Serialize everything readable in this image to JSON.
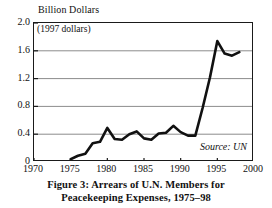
{
  "figure": {
    "y_axis_title": "Billion Dollars",
    "deflator_note": "(1997 dollars)",
    "source_note": "Source: UN",
    "caption_line1": "Figure 3: Arrears of U.N. Members for",
    "caption_line2": "Peacekeeping Expenses, 1975–98"
  },
  "chart_data": {
    "type": "line",
    "title": "Figure 3: Arrears of U.N. Members for Peacekeeping Expenses, 1975–98",
    "subtitle": "(1997 dollars)",
    "xlabel": "",
    "ylabel": "Billion Dollars",
    "xlim": [
      1970,
      2000
    ],
    "ylim": [
      0,
      2.0
    ],
    "xticks": [
      1970,
      1975,
      1980,
      1985,
      1990,
      1995,
      2000
    ],
    "xtick_labels": [
      "1970",
      "1975",
      "1980",
      "1985",
      "1990",
      "1995",
      "2000"
    ],
    "yticks": [
      0,
      0.4,
      0.8,
      1.2,
      1.6,
      2.0
    ],
    "ytick_labels": [
      "0",
      "0.4",
      "0.8",
      "1.2",
      "1.6",
      "2.0"
    ],
    "grid": "horizontal",
    "legend": "none",
    "annotations": [
      "(1997 dollars)",
      "Source: UN"
    ],
    "line_color": "#111111",
    "grid_color": "#8c8c8c",
    "series": [
      {
        "name": "Arrears of U.N. Members for Peacekeeping Expenses",
        "x": [
          1975,
          1976,
          1977,
          1978,
          1979,
          1980,
          1981,
          1982,
          1983,
          1984,
          1985,
          1986,
          1987,
          1988,
          1989,
          1990,
          1991,
          1992,
          1993,
          1994,
          1995,
          1996,
          1997,
          1998
        ],
        "values": [
          0.04,
          0.09,
          0.12,
          0.27,
          0.29,
          0.49,
          0.33,
          0.32,
          0.4,
          0.44,
          0.34,
          0.32,
          0.41,
          0.42,
          0.52,
          0.43,
          0.38,
          0.38,
          0.78,
          1.22,
          1.74,
          1.56,
          1.53,
          1.58
        ]
      }
    ]
  }
}
